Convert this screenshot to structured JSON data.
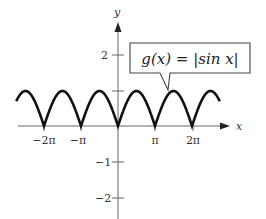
{
  "chart_data": {
    "type": "line",
    "title": "",
    "function_label": "g(x) = |sin x|",
    "xlabel": "x",
    "ylabel": "y",
    "x_ticks": [
      "-2π",
      "-π",
      "π",
      "2π"
    ],
    "y_ticks": [
      "2",
      "-1",
      "-2"
    ],
    "y_tick_unlabeled": [
      1
    ],
    "xlim": [
      -2.75,
      2.75
    ],
    "xlim_units": "multiples of π (curve drawn approx from -2.75π to 2.75π)",
    "ylim": [
      -2.5,
      2.8
    ],
    "grid": false,
    "legend": "callout box pointing to curve",
    "series": [
      {
        "name": "g(x) = |sin x|",
        "x": [
          "-2.75π",
          "-2.5π",
          "-2π",
          "-1.5π",
          "-π",
          "-0.5π",
          "0",
          "0.5π",
          "π",
          "1.5π",
          "2π",
          "2.5π",
          "2.75π"
        ],
        "y": [
          0.71,
          1,
          0,
          1,
          0,
          1,
          0,
          1,
          0,
          1,
          0,
          1,
          0.71
        ]
      }
    ]
  },
  "labels": {
    "x_axis": "x",
    "y_axis": "y",
    "tick_neg2pi": "−2π",
    "tick_negpi": "−π",
    "tick_pi": "π",
    "tick_2pi": "2π",
    "tick_y2": "2",
    "tick_yneg1": "−1",
    "tick_yneg2": "−2",
    "callout": "g(x) = |sin x|"
  },
  "colors": {
    "curve": "#111111",
    "axis": "#555555",
    "text": "#333333"
  }
}
